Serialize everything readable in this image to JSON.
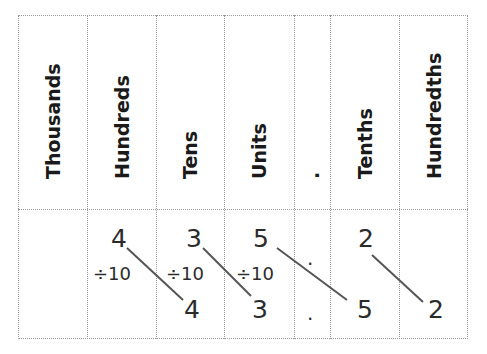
{
  "table": {
    "columns": [
      {
        "label": "Thousands",
        "x": 18,
        "w": 69
      },
      {
        "label": "Hundreds",
        "x": 87,
        "w": 69
      },
      {
        "label": "Tens",
        "x": 156,
        "w": 68
      },
      {
        "label": "Units",
        "x": 224,
        "w": 70
      },
      {
        "label": ".",
        "x": 294,
        "w": 36
      },
      {
        "label": "Tenths",
        "x": 330,
        "w": 69
      },
      {
        "label": "Hundredths",
        "x": 399,
        "w": 69
      }
    ],
    "original_number": {
      "hundreds": "4",
      "tens": "3",
      "units": "5",
      "point": ".",
      "tenths": "2"
    },
    "result_number": {
      "tens": "4",
      "units": "3",
      "point": ".",
      "tenths": "5",
      "hundredths": "2"
    },
    "operation_labels": [
      "÷10",
      "÷10",
      "÷10"
    ]
  },
  "colors": {
    "border": "#9a9a9a",
    "text": "#2b2b2b",
    "line": "#555555"
  }
}
